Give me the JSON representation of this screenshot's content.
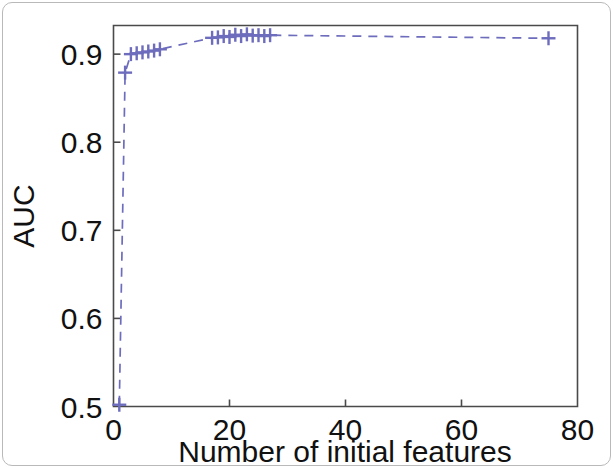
{
  "figure": {
    "name": "auc-vs-initial-features-plot",
    "border_color": "#b9b9b9",
    "background": "#ffffff"
  },
  "chart_data": {
    "type": "line",
    "title": "",
    "subtitle": "",
    "xlabel": "Number of initial features",
    "ylabel": "AUC",
    "xlim": [
      0,
      80
    ],
    "ylim": [
      0.5,
      0.9325
    ],
    "xticks": [
      0,
      20,
      40,
      60,
      80
    ],
    "xticklabels": [
      "0",
      "20",
      "40",
      "60",
      "80"
    ],
    "yticks": [
      0.5,
      0.6,
      0.7,
      0.8,
      0.9
    ],
    "yticklabels": [
      "0.5",
      "0.6",
      "0.7",
      "0.8",
      "0.9"
    ],
    "grid": false,
    "legend": null,
    "legend_position": "none",
    "series": [
      {
        "name": "AUC",
        "color": "#6d6cbd",
        "linestyle": "dashed",
        "marker": "plus",
        "x": [
          1,
          2,
          3,
          4,
          5,
          6,
          7,
          8,
          17,
          18,
          19,
          20,
          21,
          22,
          23,
          24,
          25,
          26,
          27,
          75
        ],
        "y": [
          0.502,
          0.879,
          0.9,
          0.901,
          0.902,
          0.903,
          0.904,
          0.9055,
          0.9185,
          0.919,
          0.9205,
          0.9195,
          0.922,
          0.9205,
          0.9225,
          0.921,
          0.9215,
          0.9205,
          0.9215,
          0.918
        ]
      }
    ],
    "annotations": []
  }
}
